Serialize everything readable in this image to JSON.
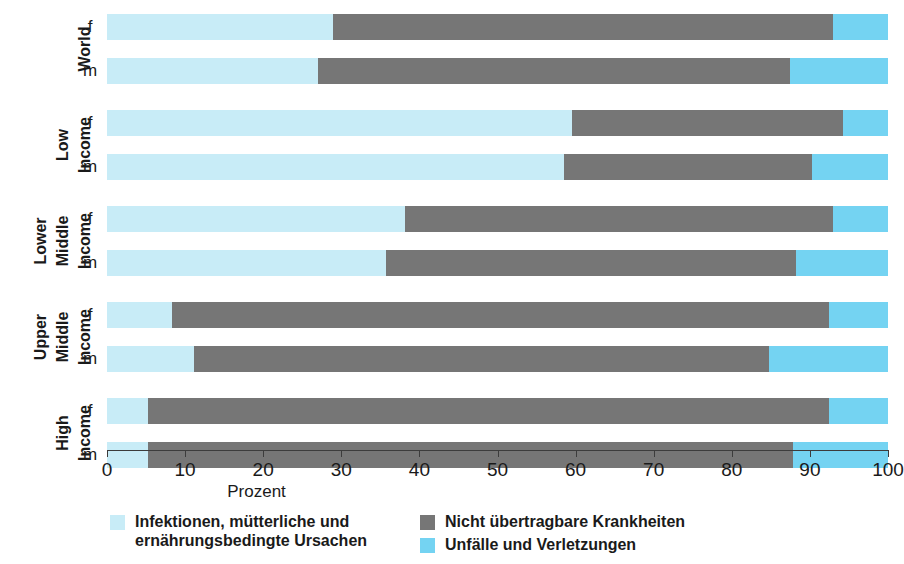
{
  "chart_data": {
    "type": "bar",
    "orientation": "horizontal",
    "stacked": true,
    "title": "",
    "xlabel": "Prozent",
    "ylabel": "",
    "xlim": [
      0,
      100
    ],
    "xticks": [
      0,
      10,
      20,
      30,
      40,
      50,
      60,
      70,
      80,
      90,
      100
    ],
    "grid": false,
    "legend_position": "bottom",
    "groups": [
      {
        "label_lines": [
          "World"
        ],
        "rows": [
          {
            "sex": "f",
            "values": [
              29.0,
              63.9,
              7.1
            ]
          },
          {
            "sex": "m",
            "values": [
              27.0,
              60.4,
              12.6
            ]
          }
        ]
      },
      {
        "label_lines": [
          "Low",
          "Income"
        ],
        "rows": [
          {
            "sex": "f",
            "values": [
              59.5,
              34.8,
              5.7
            ]
          },
          {
            "sex": "m",
            "values": [
              58.5,
              31.8,
              9.7
            ]
          }
        ]
      },
      {
        "label_lines": [
          "Lower",
          "Middle",
          "Income"
        ],
        "rows": [
          {
            "sex": "f",
            "values": [
              38.2,
              54.7,
              7.1
            ]
          },
          {
            "sex": "m",
            "values": [
              35.7,
              52.5,
              11.8
            ]
          }
        ]
      },
      {
        "label_lines": [
          "Upper",
          "Middle",
          "Income"
        ],
        "rows": [
          {
            "sex": "f",
            "values": [
              8.3,
              84.2,
              7.5
            ]
          },
          {
            "sex": "m",
            "values": [
              11.2,
              73.5,
              15.3
            ]
          }
        ]
      },
      {
        "label_lines": [
          "High",
          "Income"
        ],
        "rows": [
          {
            "sex": "f",
            "values": [
              5.3,
              87.1,
              7.6
            ]
          },
          {
            "sex": "m",
            "values": [
              5.3,
              82.5,
              12.2
            ]
          }
        ]
      }
    ],
    "series": [
      {
        "name": "Infektionen, mütterliche und\nernährungsbedingte Ursachen",
        "color": "#c8ecf7"
      },
      {
        "name": "Nicht übertragbare Krankheiten",
        "color": "#767676"
      },
      {
        "name": "Unfälle und Verletzungen",
        "color": "#74d3f2"
      }
    ]
  },
  "axis": {
    "x_title": "Prozent",
    "tick_labels": [
      "0",
      "10",
      "20",
      "30",
      "40",
      "50",
      "60",
      "70",
      "80",
      "90",
      "100"
    ]
  },
  "legend": {
    "items": [
      {
        "label": "Infektionen, mütterliche und\nernährungsbedingte Ursachen",
        "color": "#c8ecf7"
      },
      {
        "label": "Nicht übertragbare Krankheiten",
        "color": "#767676"
      },
      {
        "label": "Unfälle und Verletzungen",
        "color": "#74d3f2"
      }
    ]
  },
  "colors": {
    "infectious": "#c8ecf7",
    "noncommunicable": "#767676",
    "injuries": "#74d3f2",
    "axis": "#3c3c3c",
    "text": "#1a1a1a",
    "background": "#ffffff"
  }
}
